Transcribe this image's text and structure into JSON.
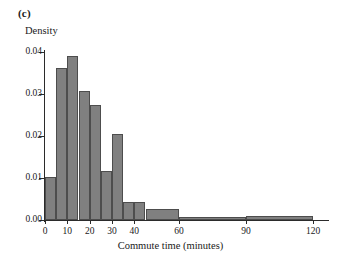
{
  "figure": {
    "panel_label": "(c)",
    "background_color": "#ffffff"
  },
  "chart_data": {
    "type": "bar",
    "title": "",
    "subtitle": "",
    "xlabel": "Commute time (minutes)",
    "ylabel": "Density",
    "xlim": [
      0,
      120
    ],
    "ylim": [
      0.0,
      0.04
    ],
    "grid": false,
    "legend": "none",
    "bar_fill_color": "#808080",
    "bar_edge_color": "#4d4d4d",
    "axis_color": "#2b2b2b",
    "xticks": [
      0,
      10,
      20,
      30,
      40,
      60,
      90,
      120
    ],
    "xtick_labels": [
      "0",
      "10",
      "20",
      "30",
      "40",
      "60",
      "90",
      "120"
    ],
    "yticks": [
      0.0,
      0.01,
      0.02,
      0.03,
      0.04
    ],
    "ytick_labels": [
      "0.00",
      "0.01",
      "0.02",
      "0.03",
      "0.04"
    ],
    "bins": [
      {
        "x0": 0,
        "x1": 5,
        "density": 0.0103
      },
      {
        "x0": 5,
        "x1": 10,
        "density": 0.0361
      },
      {
        "x0": 10,
        "x1": 15,
        "density": 0.039
      },
      {
        "x0": 15,
        "x1": 20,
        "density": 0.0306
      },
      {
        "x0": 20,
        "x1": 25,
        "density": 0.0275
      },
      {
        "x0": 25,
        "x1": 30,
        "density": 0.0116
      },
      {
        "x0": 30,
        "x1": 35,
        "density": 0.0205
      },
      {
        "x0": 35,
        "x1": 40,
        "density": 0.0042
      },
      {
        "x0": 40,
        "x1": 45,
        "density": 0.0043
      },
      {
        "x0": 45,
        "x1": 60,
        "density": 0.0027
      },
      {
        "x0": 60,
        "x1": 90,
        "density": 0.0008
      },
      {
        "x0": 90,
        "x1": 120,
        "density": 0.0009
      }
    ]
  }
}
